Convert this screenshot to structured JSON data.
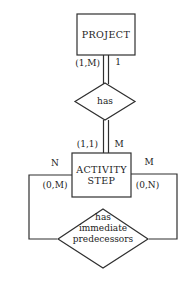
{
  "colors": {
    "line": "#2f2f2f",
    "text": "#1c1c1c",
    "background": "#ffffff"
  },
  "diagram": {
    "type": "entity-relationship",
    "entities": {
      "project": {
        "label": "PROJECT"
      },
      "activity_step": {
        "label_line1": "ACTIVITY",
        "label_line2": "STEP"
      }
    },
    "relationships": {
      "has": {
        "label": "has"
      },
      "has_immediate_predecessors": {
        "label_line1": "has",
        "label_line2": "immediate",
        "label_line3": "predecessors"
      }
    },
    "cardinalities": {
      "project_to_has_pair": "(1,M)",
      "project_to_has_single": "1",
      "activity_to_has_pair": "(1,1)",
      "activity_to_has_single": "M",
      "recursive_left_role": "N",
      "recursive_left_pair": "(0,M)",
      "recursive_right_role": "M",
      "recursive_right_pair": "(0,N)"
    }
  }
}
